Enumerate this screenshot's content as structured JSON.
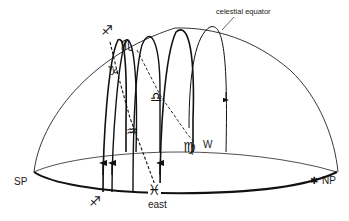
{
  "diagram": {
    "type": "celestial-sphere-hemisphere",
    "labels": {
      "celestial_equator": "celestial equator",
      "south_pole": "SP",
      "north_pole": "NP",
      "east": "east",
      "west": "W"
    },
    "zodiac_markers": {
      "sagittarius_top": "♐",
      "scorpio": "♏",
      "capricorn": "♑",
      "libra": "♎",
      "aquarius": "♒",
      "virgo": "♍",
      "pisces": "♓",
      "sagittarius_bottom": "♐"
    },
    "pole_marker": "✱",
    "colors": {
      "line": "#1a1a1a",
      "background": "#ffffff"
    }
  }
}
